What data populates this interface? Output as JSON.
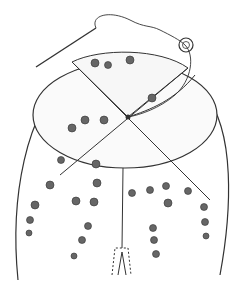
{
  "illustration": {
    "subject": "embroidered cap with pleated crown sections, needle and thread",
    "colors": {
      "line": "#333333",
      "flower": "#555555",
      "shade": "#bbbbbb",
      "background": "#ffffff"
    }
  }
}
